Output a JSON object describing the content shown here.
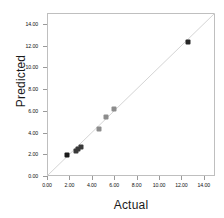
{
  "chart_data": {
    "type": "scatter",
    "title": "",
    "xlabel": "Actual",
    "ylabel": "Predicted",
    "xlim": [
      0,
      15
    ],
    "ylim": [
      0,
      15
    ],
    "grid": false,
    "legend": null,
    "xticks": [
      "0.00",
      "2.00",
      "4.00",
      "6.00",
      "8.00",
      "10.00",
      "12.00",
      "14.00"
    ],
    "xtick_values": [
      0,
      2,
      4,
      6,
      8,
      10,
      12,
      14
    ],
    "yticks": [
      "0.00",
      "2.00",
      "4.00",
      "6.00",
      "8.00",
      "10.00",
      "12.00",
      "14.00"
    ],
    "ytick_values": [
      0,
      2,
      4,
      6,
      8,
      10,
      12,
      14
    ],
    "reference_line": {
      "name": "identity-line",
      "from": [
        0,
        0
      ],
      "to": [
        15,
        15
      ],
      "color": "#d4d4d4"
    },
    "points": [
      {
        "x": 1.8,
        "y": 1.9,
        "color": "#1a1a1a"
      },
      {
        "x": 2.6,
        "y": 2.3,
        "color": "#3a3a3a"
      },
      {
        "x": 2.8,
        "y": 2.5,
        "color": "#3a3a3a"
      },
      {
        "x": 3.0,
        "y": 2.7,
        "color": "#3a3a3a"
      },
      {
        "x": 4.6,
        "y": 4.3,
        "color": "#8c8c8c"
      },
      {
        "x": 5.3,
        "y": 5.4,
        "color": "#8c8c8c"
      },
      {
        "x": 6.0,
        "y": 6.15,
        "color": "#8c8c8c"
      },
      {
        "x": 12.6,
        "y": 12.3,
        "color": "#262626"
      }
    ],
    "marker": "square",
    "frame_color": "#bfbfbf",
    "background": "#ffffff"
  }
}
